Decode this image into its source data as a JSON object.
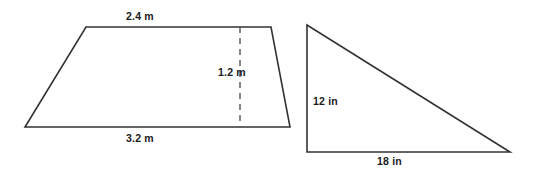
{
  "figure": {
    "background_color": "#ffffff",
    "stroke_color": "#333333",
    "text_color": "#1a1a1a",
    "shapes": [
      {
        "name": "trapezoid",
        "type": "trapezoid",
        "vertices": [
          [
            25,
            127
          ],
          [
            86,
            27
          ],
          [
            271,
            27
          ],
          [
            290,
            127
          ]
        ],
        "height_line": {
          "x": 240,
          "y1": 27,
          "y2": 127,
          "style": "dashed"
        },
        "labels": {
          "top_base": "2.4 m",
          "height": "1.2 m",
          "bottom_base": "3.2 m"
        }
      },
      {
        "name": "right-triangle",
        "type": "right triangle",
        "vertices": [
          [
            307,
            25
          ],
          [
            307,
            152
          ],
          [
            510,
            152
          ]
        ],
        "labels": {
          "vertical_leg": "12 in",
          "horizontal_leg": "18 in"
        }
      }
    ]
  },
  "labels": {
    "trapezoid_top_base": "2.4 m",
    "trapezoid_height": "1.2 m",
    "trapezoid_bottom_base": "3.2 m",
    "triangle_vertical_leg": "12 in",
    "triangle_horizontal_leg": "18 in"
  }
}
